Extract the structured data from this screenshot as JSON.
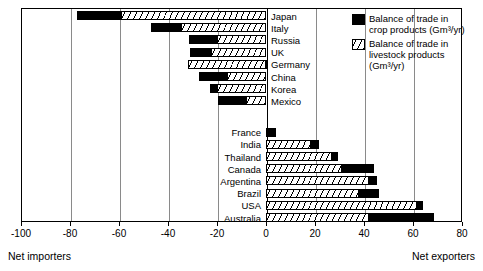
{
  "chart_data": {
    "type": "bar",
    "orientation": "horizontal",
    "stacked": true,
    "title": "",
    "xlabel": "",
    "ylabel": "",
    "xlim": [
      -100,
      80
    ],
    "xticks": [
      -100,
      -80,
      -60,
      -40,
      -20,
      0,
      20,
      40,
      60,
      80
    ],
    "xtick_labels": [
      "-100",
      "-80",
      "-60",
      "-40",
      "-20",
      "0",
      "20",
      "40",
      "60",
      "80"
    ],
    "grid": "vertical",
    "legend_position": "top-right",
    "unit": "Gm³/yr",
    "series": [
      {
        "name": "Balance of trade in crop products (Gm³/yr)",
        "key": "crop",
        "fill": "solid-black",
        "values": [
          -18.0,
          -12.5,
          -11.5,
          -8.5,
          1.0,
          -11.5,
          -3.0,
          -11.5,
          3.0,
          3.0,
          2.5,
          13.0,
          3.5,
          8.0,
          2.5,
          26.5
        ]
      },
      {
        "name": "Balance of trade in livestock products (Gm³/yr)",
        "key": "livestock",
        "fill": "hatched",
        "values": [
          -59.0,
          -34.5,
          -20.0,
          -22.5,
          -32.0,
          -16.0,
          -20.0,
          -8.0,
          1.0,
          18.5,
          27.0,
          31.0,
          42.0,
          38.0,
          61.5,
          42.0
        ]
      }
    ],
    "categories": [
      "Japan",
      "Italy",
      "Russia",
      "UK",
      "Germany",
      "China",
      "Korea",
      "Mexico",
      "France",
      "India",
      "Thailand",
      "Canada",
      "Argentina",
      "Brazil",
      "USA",
      "Australia"
    ],
    "groups": [
      {
        "name": "Net importers",
        "label_side": "right",
        "rows": [
          {
            "category": "Japan",
            "crop_start": -77.0,
            "crop_end": -59.0,
            "livestock_start": -59.0,
            "livestock_end": 0
          },
          {
            "category": "Italy",
            "crop_start": -47.0,
            "crop_end": -34.5,
            "livestock_start": -34.5,
            "livestock_end": 0
          },
          {
            "category": "Russia",
            "crop_start": -31.5,
            "crop_end": -20.0,
            "livestock_start": -20.0,
            "livestock_end": 0
          },
          {
            "category": "UK",
            "crop_start": -31.0,
            "crop_end": -22.5,
            "livestock_start": -22.5,
            "livestock_end": 0
          },
          {
            "category": "Germany",
            "crop_start": 0,
            "crop_end": 1.0,
            "livestock_start": -32.0,
            "livestock_end": 0
          },
          {
            "category": "China",
            "crop_start": -27.5,
            "crop_end": -16.0,
            "livestock_start": -16.0,
            "livestock_end": 0
          },
          {
            "category": "Korea",
            "crop_start": -23.0,
            "crop_end": -20.0,
            "livestock_start": -20.0,
            "livestock_end": 0
          },
          {
            "category": "Mexico",
            "crop_start": -19.5,
            "crop_end": -8.0,
            "livestock_start": -8.0,
            "livestock_end": 0
          }
        ]
      },
      {
        "name": "Net exporters",
        "label_side": "left",
        "rows": [
          {
            "category": "France",
            "crop_start": 1.0,
            "crop_end": 4.0,
            "livestock_start": 0,
            "livestock_end": 1.0
          },
          {
            "category": "India",
            "crop_start": 18.5,
            "crop_end": 21.5,
            "livestock_start": 0,
            "livestock_end": 18.5
          },
          {
            "category": "Thailand",
            "crop_start": 27.0,
            "crop_end": 29.5,
            "livestock_start": 0,
            "livestock_end": 27.0
          },
          {
            "category": "Canada",
            "crop_start": 31.0,
            "crop_end": 44.0,
            "livestock_start": 0,
            "livestock_end": 31.0
          },
          {
            "category": "Argentina",
            "crop_start": 42.0,
            "crop_end": 45.5,
            "livestock_start": 0,
            "livestock_end": 42.0
          },
          {
            "category": "Brazil",
            "crop_start": 38.0,
            "crop_end": 46.0,
            "livestock_start": 0,
            "livestock_end": 38.0
          },
          {
            "category": "USA",
            "crop_start": 61.5,
            "crop_end": 64.0,
            "livestock_start": 0,
            "livestock_end": 61.5
          },
          {
            "category": "Australia",
            "crop_start": 42.0,
            "crop_end": 68.5,
            "livestock_start": 0,
            "livestock_end": 42.0
          }
        ]
      }
    ],
    "annotations": {
      "left_note": "Net importers",
      "right_note": "Net exporters"
    },
    "legend": {
      "entries": [
        {
          "swatch": "crop",
          "text": "Balance of trade in\ncrop products (Gm³/yr)"
        },
        {
          "swatch": "live",
          "text": "Balance of trade in\nlivestock products\n(Gm³/yr)"
        }
      ]
    }
  }
}
